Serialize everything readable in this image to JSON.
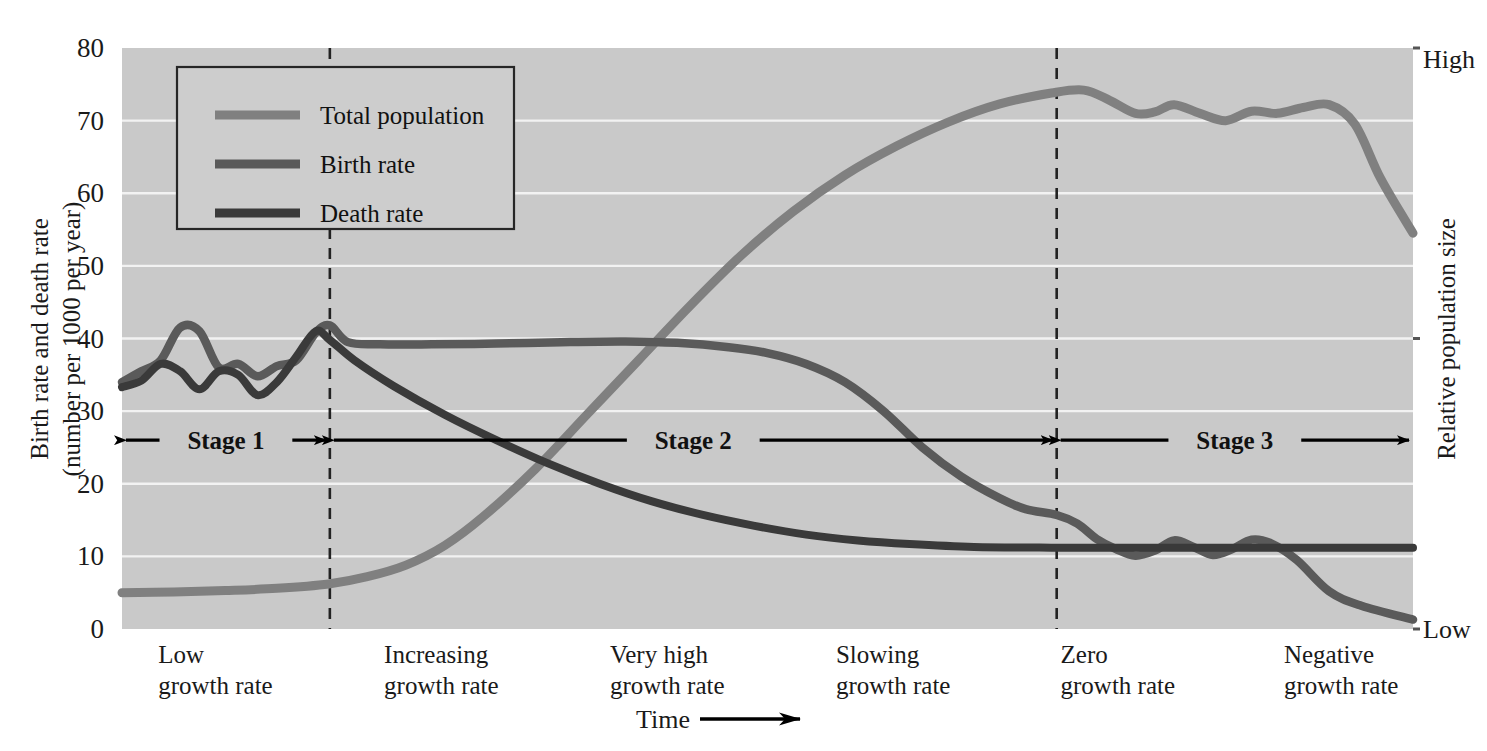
{
  "chart_data": {
    "type": "line",
    "title": "",
    "plot_background": "#c9c9c9",
    "gridlines": true,
    "legend_position": "top-left-inside",
    "xlabel": "Time",
    "ylabel": "Birth rate and death rate (number per 1000 per year)",
    "y2label": "Relative population size",
    "ylim": [
      0,
      80
    ],
    "yticks": [
      "0",
      "10",
      "20",
      "30",
      "40",
      "50",
      "60",
      "70",
      "80"
    ],
    "y2_top_label": "High",
    "y2_bottom_label": "Low",
    "x_axis_arrow": true,
    "stage_dividers_x_fraction": [
      0.161,
      0.724
    ],
    "legend": [
      {
        "label": "Total population",
        "color": "#808080"
      },
      {
        "label": "Birth rate",
        "color": "#5a5a5a"
      },
      {
        "label": "Death rate",
        "color": "#3a3a3a"
      }
    ],
    "stages": [
      {
        "label": "Stage 1",
        "start_fraction": 0.0,
        "end_fraction": 0.161
      },
      {
        "label": "Stage 2",
        "start_fraction": 0.161,
        "end_fraction": 0.724
      },
      {
        "label": "Stage 3",
        "start_fraction": 0.724,
        "end_fraction": 1.0
      }
    ],
    "stage_band_y_value": 26,
    "category_labels": [
      {
        "line1": "Low",
        "line2": "growth rate",
        "x_fraction": 0.028
      },
      {
        "line1": "Increasing",
        "line2": "growth rate",
        "x_fraction": 0.203
      },
      {
        "line1": "Very high",
        "line2": "growth rate",
        "x_fraction": 0.378
      },
      {
        "line1": "Slowing",
        "line2": "growth rate",
        "x_fraction": 0.553
      },
      {
        "line1": "Zero",
        "line2": "growth rate",
        "x_fraction": 0.727
      },
      {
        "line1": "Negative",
        "line2": "growth rate",
        "x_fraction": 0.9
      }
    ],
    "series": [
      {
        "name": "Total population",
        "color": "#808080",
        "note": "relative population size, plotted on the 0-80 scale",
        "x": [
          0.0,
          0.04,
          0.08,
          0.12,
          0.16,
          0.19,
          0.22,
          0.25,
          0.28,
          0.32,
          0.36,
          0.4,
          0.44,
          0.48,
          0.52,
          0.56,
          0.6,
          0.64,
          0.68,
          0.72,
          0.745,
          0.765,
          0.785,
          0.8,
          0.815,
          0.835,
          0.855,
          0.875,
          0.895,
          0.915,
          0.935,
          0.955,
          0.975,
          1.0
        ],
        "values": [
          5.0,
          5.1,
          5.3,
          5.6,
          6.2,
          7.2,
          8.8,
          11.5,
          15.5,
          22.0,
          29.5,
          37.0,
          44.5,
          51.5,
          57.5,
          62.5,
          66.5,
          69.8,
          72.3,
          73.8,
          74.2,
          72.8,
          71.0,
          71.2,
          72.2,
          71.0,
          70.0,
          71.3,
          71.0,
          71.8,
          72.2,
          69.5,
          62.0,
          54.5
        ]
      },
      {
        "name": "Birth rate",
        "color": "#5a5a5a",
        "x": [
          0.0,
          0.015,
          0.03,
          0.045,
          0.06,
          0.075,
          0.09,
          0.105,
          0.12,
          0.135,
          0.15,
          0.161,
          0.175,
          0.2,
          0.24,
          0.29,
          0.34,
          0.39,
          0.43,
          0.47,
          0.5,
          0.53,
          0.56,
          0.59,
          0.62,
          0.65,
          0.68,
          0.7,
          0.724,
          0.74,
          0.755,
          0.77,
          0.785,
          0.8,
          0.815,
          0.83,
          0.845,
          0.86,
          0.875,
          0.89,
          0.91,
          0.935,
          0.96,
          1.0
        ],
        "values": [
          34.0,
          35.5,
          37.0,
          41.5,
          41.0,
          36.0,
          36.5,
          34.8,
          36.2,
          37.0,
          40.8,
          41.8,
          39.5,
          39.2,
          39.2,
          39.3,
          39.5,
          39.6,
          39.4,
          38.8,
          38.0,
          36.5,
          34.0,
          30.0,
          25.0,
          21.0,
          18.0,
          16.5,
          15.7,
          14.5,
          12.4,
          11.0,
          10.1,
          10.8,
          12.2,
          11.3,
          10.2,
          11.0,
          12.3,
          11.8,
          9.5,
          5.2,
          3.2,
          1.3
        ]
      },
      {
        "name": "Death rate",
        "color": "#3a3a3a",
        "x": [
          0.0,
          0.015,
          0.03,
          0.045,
          0.06,
          0.075,
          0.09,
          0.105,
          0.12,
          0.135,
          0.15,
          0.161,
          0.18,
          0.21,
          0.25,
          0.29,
          0.33,
          0.37,
          0.41,
          0.45,
          0.49,
          0.53,
          0.57,
          0.61,
          0.66,
          0.72,
          0.8,
          0.9,
          1.0
        ],
        "values": [
          33.3,
          34.2,
          36.5,
          35.5,
          33.0,
          35.5,
          35.0,
          32.2,
          34.0,
          37.5,
          41.0,
          39.8,
          37.0,
          33.5,
          29.5,
          26.0,
          22.8,
          20.0,
          17.6,
          15.7,
          14.2,
          13.0,
          12.2,
          11.7,
          11.3,
          11.2,
          11.2,
          11.2,
          11.2
        ]
      }
    ]
  }
}
